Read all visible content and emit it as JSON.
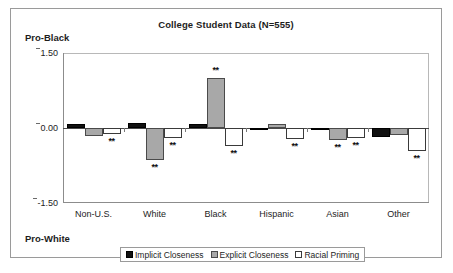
{
  "chart_data": {
    "type": "bar",
    "title": "College Student Data (N=555)",
    "xlabel": "",
    "ylabel": "",
    "ylim": [
      -1.5,
      1.5
    ],
    "yticks": [
      "1.50",
      "0.00",
      "-1.50"
    ],
    "grid": false,
    "legend_position": "bottom",
    "axis_endpoint_labels": {
      "top": "Pro-Black",
      "bottom": "Pro-White"
    },
    "categories": [
      "Non-U.S.",
      "White",
      "Black",
      "Hispanic",
      "Asian",
      "Other"
    ],
    "series": [
      {
        "name": "Implicit Closeness",
        "color": "#111111",
        "values": [
          0.09,
          0.1,
          0.08,
          -0.03,
          -0.04,
          -0.17
        ],
        "significance": [
          "",
          "",
          "",
          "",
          "",
          ""
        ]
      },
      {
        "name": "Explicit Closeness",
        "color": "#a8a8a8",
        "values": [
          -0.15,
          -0.64,
          1.0,
          0.09,
          -0.23,
          -0.13
        ],
        "significance": [
          "",
          "**",
          "**",
          "",
          "**",
          ""
        ]
      },
      {
        "name": "Racial Priming",
        "color": "#ffffff",
        "values": [
          -0.12,
          -0.2,
          -0.35,
          -0.22,
          -0.2,
          -0.45
        ],
        "significance": [
          "**",
          "**",
          "**",
          "**",
          "**",
          "**"
        ]
      }
    ],
    "significance_marker": "**"
  },
  "legend": {
    "items": [
      {
        "label": "Implicit Closeness",
        "swatch": "black-square-icon"
      },
      {
        "label": "Explicit Closeness",
        "swatch": "gray-square-icon"
      },
      {
        "label": "Racial Priming",
        "swatch": "white-square-icon"
      }
    ]
  }
}
